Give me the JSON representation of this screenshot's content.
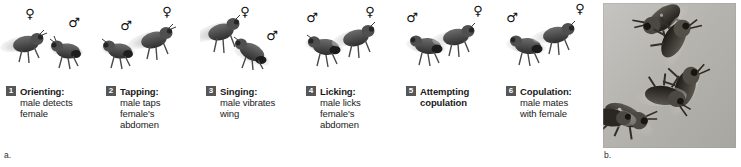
{
  "figure": {
    "panel_labels": {
      "left": "a.",
      "right": "b."
    }
  },
  "panel_a": {
    "name": "drosophila-courtship-ritual-stages",
    "stages": [
      {
        "number": "1",
        "title": "Orienting:",
        "body_lines": [
          "male detects",
          "female"
        ],
        "body_bold": false,
        "symbols": [
          "female",
          "male"
        ]
      },
      {
        "number": "2",
        "title": "Tapping:",
        "body_lines": [
          "male taps",
          "female's",
          "abdomen"
        ],
        "body_bold": false,
        "symbols": [
          "male",
          "female"
        ]
      },
      {
        "number": "3",
        "title": "Singing:",
        "body_lines": [
          "male vibrates",
          "wing"
        ],
        "body_bold": false,
        "symbols": [
          "female",
          "male"
        ]
      },
      {
        "number": "4",
        "title": "Licking:",
        "body_lines": [
          "male licks",
          "female's",
          "abdomen"
        ],
        "body_bold": false,
        "symbols": [
          "male",
          "female"
        ]
      },
      {
        "number": "5",
        "title": "Attempting",
        "body_lines": [
          "copulation"
        ],
        "body_bold": true,
        "symbols": [
          "male",
          "female"
        ]
      },
      {
        "number": "6",
        "title": "Copulation:",
        "body_lines": [
          "male mates",
          "with female"
        ],
        "body_bold": false,
        "symbols": [
          "male",
          "female"
        ]
      }
    ],
    "symbol_glyphs": {
      "female": "♀",
      "male": "♂"
    },
    "badge_color": "#565656",
    "badge_text_color": "#ffffff",
    "text_color": "#1a1a1a"
  },
  "panel_b": {
    "name": "fruit-fly-courtship-chain-photograph",
    "description": "grayscale photograph of fruit flies forming a courtship chain",
    "background_color": "#b9b7b2"
  }
}
